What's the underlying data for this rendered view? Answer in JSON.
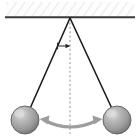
{
  "figure": {
    "type": "physics-diagram",
    "width": 140,
    "height": 137,
    "background_color": "#ffffff"
  },
  "ceiling": {
    "label": "Fixed support / ceiling",
    "bar_color": "#3a3a3a",
    "hatch_color": "#e8e8e8",
    "hatch_fill": "#fdfdfd",
    "x": 6,
    "y": 2,
    "width": 128,
    "bar_y": 17,
    "hatch_height": 15
  },
  "pivot": {
    "label": "Pivot point",
    "x": 70,
    "y": 18
  },
  "strings": [
    {
      "name": "left-string",
      "label": "Pendulum string (left extreme)",
      "x1": 70,
      "y1": 18,
      "x2": 28,
      "y2": 113,
      "color": "#1e1e1e",
      "width": 1.6
    },
    {
      "name": "right-string",
      "label": "Pendulum string (right extreme)",
      "x1": 70,
      "y1": 18,
      "x2": 114,
      "y2": 113,
      "color": "#1e1e1e",
      "width": 1.6
    }
  ],
  "equilibrium_line": {
    "label": "Equilibrium / vertical reference line",
    "x": 70,
    "y1": 18,
    "y2": 134,
    "color": "#9a9a9a",
    "dash": "2,2.4",
    "width": 1.1
  },
  "angle_marker": {
    "label": "Angular displacement indicator",
    "y": 46,
    "x_from": 57,
    "x_to": 70,
    "color": "#262626",
    "width": 1.0,
    "symbol": ""
  },
  "bobs": [
    {
      "name": "left-bob",
      "label": "Pendulum bob (left extreme position)",
      "cx": 25,
      "cy": 120,
      "r": 14,
      "highlight_color": "#d6d6d6",
      "mid_color": "#a8a8a8",
      "edge_color": "#707070",
      "stroke_color": "#5d5d5d"
    },
    {
      "name": "right-bob",
      "label": "Pendulum bob (right extreme position)",
      "cx": 117,
      "cy": 120,
      "r": 14,
      "highlight_color": "#d6d6d6",
      "mid_color": "#a8a8a8",
      "edge_color": "#707070",
      "stroke_color": "#5d5d5d"
    }
  ],
  "swing_arrow": {
    "label": "Double-headed arc arrow showing swing direction",
    "color": "#9d9d9d",
    "width": 3.2,
    "path": "M 43 121 Q 70 134 99 121",
    "left_head": "43,121 51,117 49,125",
    "right_head": "99,121 91,117 93,125"
  }
}
